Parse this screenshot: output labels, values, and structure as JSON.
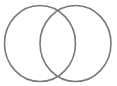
{
  "diagram": {
    "type": "venn",
    "sets": [
      {
        "name": "left-set",
        "cx": 40,
        "cy": 43.5,
        "rx": 35.5,
        "ry": 38
      },
      {
        "name": "right-set",
        "cx": 75.5,
        "cy": 43.5,
        "rx": 35.5,
        "ry": 38
      }
    ],
    "stroke_color": "#7a7a7a",
    "stroke_width": 1.6,
    "fill": "none"
  }
}
